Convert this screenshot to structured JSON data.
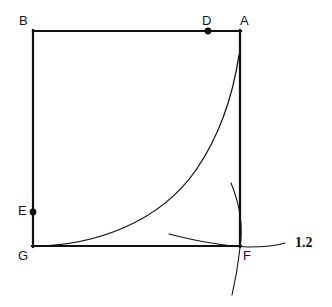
{
  "figure": {
    "background_color": "#ffffff",
    "stroke_color": "#111111",
    "width": 332,
    "height": 307
  },
  "labels": {
    "A": "A",
    "B": "B",
    "D": "D",
    "E": "E",
    "F": "F",
    "G": "G",
    "measure": "1.2"
  },
  "points": [
    {
      "name": "B",
      "label": "B",
      "x": 33,
      "y": 31,
      "marked": false
    },
    {
      "name": "D",
      "label": "D",
      "x": 208,
      "y": 31,
      "marked": true
    },
    {
      "name": "A",
      "label": "A",
      "x": 240,
      "y": 31,
      "marked": false
    },
    {
      "name": "E",
      "label": "E",
      "x": 33,
      "y": 212,
      "marked": true
    },
    {
      "name": "G",
      "label": "G",
      "x": 33,
      "y": 246,
      "marked": false
    },
    {
      "name": "F",
      "label": "F",
      "x": 240,
      "y": 246,
      "marked": false
    }
  ],
  "segments": [
    {
      "name": "side-BA-top",
      "from": "B",
      "to": "A",
      "x1": 33,
      "y1": 31,
      "x2": 240,
      "y2": 31
    },
    {
      "name": "side-BG-left",
      "from": "B",
      "to": "G",
      "x1": 33,
      "y1": 31,
      "x2": 33,
      "y2": 246
    },
    {
      "name": "side-GF-bottom",
      "from": "G",
      "to": "F",
      "x1": 33,
      "y1": 246,
      "x2": 240,
      "y2": 246
    },
    {
      "name": "side-AF-right",
      "from": "A",
      "to": "F",
      "x1": 240,
      "y1": 31,
      "x2": 240,
      "y2": 246
    }
  ],
  "curves": [
    {
      "name": "exponential-curve",
      "description": "smooth increasing curve from G rising to the right side near A",
      "path": "M 33 246 C 95 246 160 222 196 170 C 220 135 233 95 239 55"
    },
    {
      "name": "compass-arc-vertical",
      "description": "thin construction arc crossing F vertically",
      "path": "M 231 183 C 241 207 243 228 240 248 C 238 266 235 282 232 295"
    },
    {
      "name": "compass-arc-horizontal",
      "description": "thin construction arc crossing the bottom side near F",
      "path": "M 169 234 C 196 241 222 246 248 247 C 264 247 276 246 285 243"
    }
  ],
  "measure_mark": {
    "name": "length-1.2",
    "value": "1.2"
  }
}
